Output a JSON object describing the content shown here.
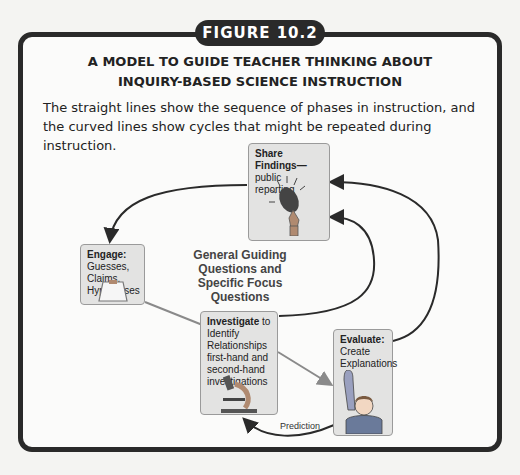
{
  "figure_label": "FIGURE 10.2",
  "title": {
    "line1": "A MODEL TO GUIDE TEACHER THINKING ABOUT",
    "line2": "INQUIRY-BASED SCIENCE INSTRUCTION"
  },
  "caption": "The straight lines show the sequence of phases in instruction, and the curved lines show cycles that might be repeated during instruction.",
  "center_label": {
    "line1": "General Guiding",
    "line2": "Questions and",
    "line3": "Specific Focus",
    "line4": "Questions"
  },
  "nodes": {
    "share": {
      "heading": "Share Findings—",
      "text": "public reporting",
      "icon": "microphone-icon"
    },
    "engage": {
      "heading": "Engage:",
      "text1": "Guesses, Claims,",
      "text2": "Hypotheses",
      "icon": "clipboard-icon"
    },
    "investigate": {
      "heading": "Investigate",
      "heading_suffix": " to",
      "text1": "Identify",
      "text2": "Relationships",
      "text3": "first-hand and",
      "text4": "second-hand",
      "text5": "investigations",
      "icon": "microscope-icon"
    },
    "evaluate": {
      "heading": "Evaluate:",
      "text1": "Create",
      "text2": "Explanations",
      "icon": "raised-hand-student-icon"
    }
  },
  "edges": [
    {
      "from": "Share Findings",
      "to": "Engage",
      "style": "curved"
    },
    {
      "from": "Engage",
      "to": "Investigate",
      "style": "straight"
    },
    {
      "from": "Investigate",
      "to": "Evaluate",
      "style": "straight"
    },
    {
      "from": "Investigate",
      "to": "Share Findings",
      "style": "curved"
    },
    {
      "from": "Evaluate",
      "to": "Share Findings",
      "style": "curved"
    },
    {
      "from": "Evaluate",
      "to": "Investigate",
      "style": "curved",
      "label": "Prediction"
    }
  ],
  "prediction_label": "Prediction",
  "colors": {
    "frame": "#2a2a2a",
    "card_bg": "#e3e3e2",
    "curve": "#2a2a2a",
    "straight": "#8a8a8a"
  }
}
